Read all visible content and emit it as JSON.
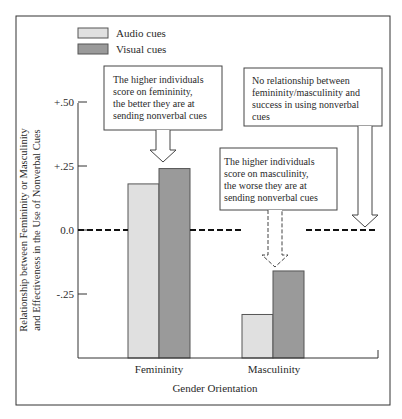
{
  "chart_data": {
    "type": "bar",
    "title": "",
    "xlabel": "Gender Orientation",
    "ylabel_lines": [
      "Relationship between Femininity or Masculinity",
      "and Effectiveness in the Use of Nonverbal Cues"
    ],
    "categories": [
      "Femininity",
      "Masculinity"
    ],
    "series": [
      {
        "name": "Audio cues",
        "color": "#e0e0e0",
        "values": [
          0.18,
          -0.33
        ]
      },
      {
        "name": "Visual cues",
        "color": "#9a9a9a",
        "values": [
          0.24,
          -0.16
        ]
      }
    ],
    "ylim": [
      -0.5,
      0.5
    ],
    "yticks": [
      {
        "value": 0.5,
        "label": "+.50"
      },
      {
        "value": 0.25,
        "label": "+.25"
      },
      {
        "value": 0.0,
        "label": "0.0"
      },
      {
        "value": -0.25,
        "label": "-.25"
      }
    ],
    "reference_line": {
      "value": 0.0,
      "style": "dashed"
    },
    "legend": {
      "placement": "top-left"
    },
    "grid": false,
    "annotations": [
      {
        "id": "femininity",
        "lines": [
          "The higher individuals",
          "score on femininity,",
          "the better they are at",
          "sending nonverbal cues"
        ]
      },
      {
        "id": "none",
        "lines": [
          "No relationship between",
          "femininity/masculinity and",
          "success in using nonverbal",
          "cues"
        ]
      },
      {
        "id": "masculinity",
        "lines": [
          "The higher individuals",
          "score on masculinity,",
          "the worse they are at",
          "sending nonverbal cues"
        ]
      }
    ]
  }
}
